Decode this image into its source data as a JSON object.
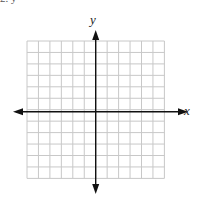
{
  "header": {
    "cropped_text": "2.   y ="
  },
  "graph": {
    "x_label": "x",
    "y_label": "y",
    "grid": {
      "columns": 12,
      "rows": 12,
      "left": 27,
      "top": 41,
      "cell": 11.45,
      "color": "#c8c8c8"
    },
    "axis_color": "#111111"
  }
}
